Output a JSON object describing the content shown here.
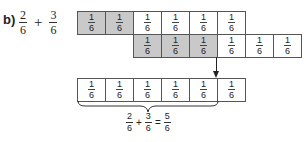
{
  "problem": {
    "label": "b)",
    "term1": {
      "num": "2",
      "den": "6"
    },
    "operator": "+",
    "term2": {
      "num": "3",
      "den": "6"
    }
  },
  "colors": {
    "shaded": "#c9c9c9",
    "unshaded": "#ffffff",
    "border": "#555555"
  },
  "rows": {
    "first_addend": {
      "cells": [
        {
          "num": "1",
          "den": "6",
          "shaded": true
        },
        {
          "num": "1",
          "den": "6",
          "shaded": true
        },
        {
          "num": "1",
          "den": "6",
          "shaded": false
        },
        {
          "num": "1",
          "den": "6",
          "shaded": false
        },
        {
          "num": "1",
          "den": "6",
          "shaded": false
        },
        {
          "num": "1",
          "den": "6",
          "shaded": false
        }
      ]
    },
    "second_addend": {
      "cells": [
        {
          "num": "1",
          "den": "6",
          "shaded": true
        },
        {
          "num": "1",
          "den": "6",
          "shaded": true
        },
        {
          "num": "1",
          "den": "6",
          "shaded": true
        },
        {
          "num": "1",
          "den": "6",
          "shaded": false
        },
        {
          "num": "1",
          "den": "6",
          "shaded": false
        },
        {
          "num": "1",
          "den": "6",
          "shaded": false
        }
      ]
    },
    "result": {
      "cells": [
        {
          "num": "1",
          "den": "6",
          "shaded": false
        },
        {
          "num": "1",
          "den": "6",
          "shaded": false
        },
        {
          "num": "1",
          "den": "6",
          "shaded": false
        },
        {
          "num": "1",
          "den": "6",
          "shaded": false
        },
        {
          "num": "1",
          "den": "6",
          "shaded": false
        },
        {
          "num": "1",
          "den": "6",
          "shaded": false
        }
      ]
    }
  },
  "equation": {
    "a": {
      "num": "2",
      "den": "6"
    },
    "plus": "+",
    "b": {
      "num": "3",
      "den": "6"
    },
    "equals": "=",
    "result": {
      "num": "5",
      "den": "6"
    }
  }
}
